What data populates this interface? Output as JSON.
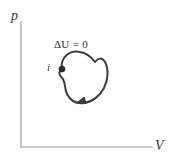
{
  "figure": {
    "type": "thermodynamic-pv-cycle-diagram",
    "background_color": "#ffffff"
  },
  "axes": {
    "y_label": "p",
    "x_label": "V",
    "color": "#b9b9b9",
    "origin": {
      "x": 21,
      "y": 147
    },
    "y_top": 22,
    "x_right": 152
  },
  "annotations": {
    "delta_u_label": "ΔU = 0",
    "initial_state_label": "i"
  },
  "cycle": {
    "color": "#3d3d3d",
    "stroke_width": 2,
    "closed": true,
    "direction": "clockwise",
    "marker_point": {
      "x": 62,
      "y": 69,
      "label": "i"
    },
    "arrowhead": {
      "x": 80,
      "y": 101,
      "points": "left"
    },
    "path": "M 62,69 C 60,57 70,50 80,52 C 88,53 92,58 95,62 C 98,58 102,57 105,62 C 109,69 108,80 104,88 C 100,96 92,102 84,103 C 76,104 70,100 67,94 C 64,88 66,82 62,78 C 59,75 58,72 62,69 Z"
  },
  "colors": {
    "curve": "#3d3d3d",
    "axis": "#b9b9b9",
    "text": "#2b2b2b"
  }
}
